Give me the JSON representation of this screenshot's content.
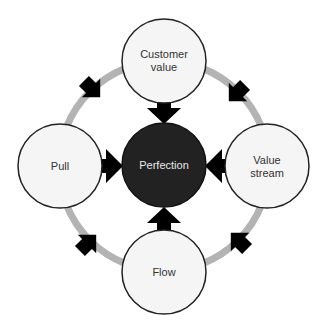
{
  "diagram": {
    "center": {
      "label": "Perfection",
      "fill": "#222222"
    },
    "nodes": [
      {
        "id": "customer-value",
        "lines": [
          "Customer",
          "value"
        ],
        "position": "top"
      },
      {
        "id": "value-stream",
        "lines": [
          "Value",
          "stream"
        ],
        "position": "right"
      },
      {
        "id": "flow",
        "lines": [
          "Flow"
        ],
        "position": "bottom"
      },
      {
        "id": "pull",
        "lines": [
          "Pull"
        ],
        "position": "left"
      }
    ],
    "colors": {
      "node_fill": "#f5f5f5",
      "node_stroke": "#222222",
      "ring": "#b3b3b3",
      "arrow": "#000000",
      "text": "#333333"
    },
    "cycle_direction": "clockwise",
    "all_nodes_point_to_center": true
  }
}
